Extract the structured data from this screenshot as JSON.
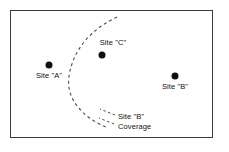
{
  "diagram": {
    "frame": {
      "border_color": "#3c3c3c",
      "fill_color": "#ffffff"
    },
    "sites": [
      {
        "id": "site-a",
        "label": "Site \"A\"",
        "dot_x": 49,
        "dot_y": 65,
        "label_x": 49,
        "label_y": 71,
        "label_position": "below",
        "color": "#101010"
      },
      {
        "id": "site-c",
        "label": "Site \"C\"",
        "dot_x": 102,
        "dot_y": 55,
        "label_x": 113,
        "label_y": 38,
        "label_position": "above",
        "color": "#101010"
      },
      {
        "id": "site-b",
        "label": "Site \"B\"",
        "dot_x": 175,
        "dot_y": 76,
        "label_x": 175,
        "label_y": 82,
        "label_position": "below",
        "color": "#101010"
      }
    ],
    "coverage_arc": {
      "name": "site-b-coverage-boundary",
      "style": "dashed",
      "color": "#4a4a4a",
      "path": "M 117 17 C 96 27, 74 45, 69 76 C 65 102, 88 120, 106 127",
      "dash_pattern": "3 3",
      "stroke_width": 1.1
    },
    "annotation": {
      "name": "site-b-coverage-annotation",
      "line1": "Site \"B\"",
      "line2": "Coverage",
      "text_x": 118,
      "text_y": 112,
      "leaders": [
        {
          "path": "M 115 115 L 100 109",
          "dash_pattern": "2.5 2.5"
        },
        {
          "path": "M 114 124 L 99 118",
          "dash_pattern": "2.5 2.5"
        }
      ],
      "color": "#4a4a4a"
    }
  }
}
